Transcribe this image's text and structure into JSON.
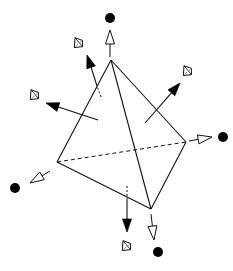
{
  "diagram": {
    "title": "",
    "colors": {
      "stroke": "#111111",
      "fill_black": "#000000",
      "background": "#ffffff"
    },
    "tetrahedron": {
      "vertices": {
        "apex": [
          111,
          60
        ],
        "left": [
          57,
          162
        ],
        "right": [
          186,
          142
        ],
        "bottom": [
          151,
          209
        ]
      },
      "solid_edges": [
        [
          "apex",
          "left"
        ],
        [
          "apex",
          "right"
        ],
        [
          "apex",
          "bottom"
        ],
        [
          "left",
          "bottom"
        ],
        [
          "right",
          "bottom"
        ]
      ],
      "hidden_edges": [
        [
          "left",
          "right"
        ]
      ]
    },
    "vertex_arrows": [
      {
        "name": "top",
        "from": [
          110,
          57
        ],
        "to": [
          110,
          30
        ],
        "dot": [
          110,
          18
        ]
      },
      {
        "name": "right",
        "from": [
          189,
          141
        ],
        "to": [
          212,
          137
        ],
        "dot": [
          223,
          137
        ]
      },
      {
        "name": "left",
        "from": [
          50,
          171
        ],
        "to": [
          30,
          183
        ],
        "dot": [
          15,
          188
        ]
      },
      {
        "name": "bottom",
        "from": [
          151,
          214
        ],
        "to": [
          154,
          240
        ],
        "dot": [
          158,
          252
        ]
      }
    ],
    "face_normals": [
      {
        "name": "upper-left",
        "from": [
          101,
          97
        ],
        "to": [
          87,
          55
        ],
        "hidden_start": [
          97,
          86
        ],
        "crystal": [
          78,
          43
        ]
      },
      {
        "name": "left",
        "from": [
          98,
          120
        ],
        "to": [
          46,
          103
        ],
        "hidden_start": null,
        "crystal": [
          34,
          95
        ]
      },
      {
        "name": "right",
        "from": [
          145,
          123
        ],
        "to": [
          180,
          83
        ],
        "hidden_start": null,
        "crystal": [
          187,
          71
        ]
      },
      {
        "name": "bottom",
        "from": [
          127,
          186
        ],
        "to": [
          127,
          232
        ],
        "hidden_start": [
          127,
          200
        ],
        "crystal": [
          126,
          246
        ]
      }
    ],
    "icons": {
      "vertex_marker": "filled-circle-icon",
      "vertex_arrow": "hollow-arrow-icon",
      "normal_arrow": "solid-arrow-icon",
      "crystal": "crystal-icon"
    }
  }
}
